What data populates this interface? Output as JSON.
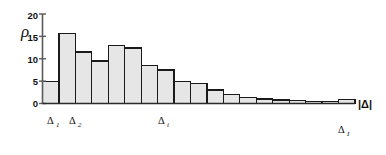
{
  "chart_data": {
    "type": "bar",
    "title": "",
    "subtitle": "",
    "ylabel": "ρ",
    "xlabel": "|Δ|",
    "ylim": [
      0,
      20
    ],
    "y_ticks": [
      0,
      5,
      10,
      15,
      20
    ],
    "y_tick_labels": [
      "0",
      "5",
      "10",
      "15",
      "20"
    ],
    "grid": false,
    "legend": null,
    "bar_fill_color": "#e6e6e6",
    "bar_edge_color": "#1a1a1a",
    "axis_color": "#4d4d4d",
    "categories": [
      "bin1",
      "bin2",
      "bin3",
      "bin4",
      "bin5",
      "bin6",
      "bin7",
      "bin8",
      "bin9",
      "bin10",
      "bin11",
      "bin12",
      "bin13",
      "bin14",
      "bin15",
      "bin16",
      "bin17",
      "bin18",
      "bin19"
    ],
    "values": [
      5.0,
      15.7,
      11.5,
      9.5,
      13.0,
      12.4,
      8.5,
      7.5,
      5.0,
      4.5,
      3.0,
      2.0,
      1.4,
      1.0,
      0.8,
      0.6,
      0.5,
      0.4,
      0.9
    ],
    "annotations": [
      {
        "name": "delta-1",
        "base": "Δ",
        "sub": "1",
        "bin_index": 0
      },
      {
        "name": "delta-2",
        "base": "Δ",
        "sub": "2",
        "bin_index": 1
      },
      {
        "name": "delta-i",
        "base": "Δ",
        "sub": "i",
        "bin_index": 6
      },
      {
        "name": "delta-I",
        "base": "Δ",
        "sub": "I",
        "bin_index": 18
      }
    ]
  },
  "axis": {
    "y_label_rho": "ρ",
    "tick_20": "20",
    "tick_15": "15",
    "tick_10": "10",
    "tick_5": "5",
    "tick_0": "0",
    "x_end_label": "|Δ|"
  },
  "x_labels": {
    "delta_1_base": "Δ",
    "delta_1_sub": "1",
    "delta_2_base": "Δ",
    "delta_2_sub": "2",
    "delta_i_base": "Δ",
    "delta_i_sub": "i",
    "delta_I_base": "Δ",
    "delta_I_sub": "I"
  }
}
